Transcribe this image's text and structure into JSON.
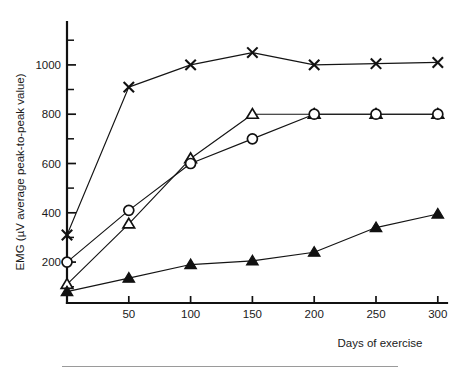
{
  "figure": {
    "background_color": "#ffffff",
    "ink_color": "#111111",
    "footer_rule_color": "#9a9a9a"
  },
  "axes": {
    "y_title": "EMG (µV average peak-to-peak value)",
    "x_title": "Days of exercise",
    "x_ticks": [
      "50",
      "100",
      "150",
      "200",
      "250",
      "300"
    ],
    "y_ticks": [
      "200",
      "400",
      "600",
      "800",
      "1000"
    ]
  },
  "chart_data": {
    "type": "line",
    "title": "",
    "subtitle": "",
    "xlabel": "Days of exercise",
    "ylabel": "EMG (µV average peak-to-peak value)",
    "xlim": [
      0,
      310
    ],
    "ylim": [
      0,
      1150
    ],
    "xticks": [
      50,
      100,
      150,
      200,
      250,
      300
    ],
    "yticks": [
      200,
      400,
      600,
      800,
      1000
    ],
    "y_minor_ticks": [
      100,
      300,
      500,
      700,
      900,
      1100
    ],
    "grid": false,
    "legend": "none",
    "x": [
      0,
      50,
      100,
      150,
      200,
      250,
      300
    ],
    "series": [
      {
        "name": "cross-series",
        "marker": "x",
        "marker_fill": "none",
        "values": [
          310,
          910,
          1000,
          1050,
          1000,
          1005,
          1010
        ]
      },
      {
        "name": "open-triangle-series",
        "marker": "triangle-up",
        "marker_fill": "open",
        "values": [
          110,
          355,
          620,
          800,
          800,
          800,
          800
        ]
      },
      {
        "name": "open-circle-series",
        "marker": "circle",
        "marker_fill": "open",
        "values": [
          200,
          410,
          600,
          700,
          800,
          800,
          800
        ]
      },
      {
        "name": "filled-triangle-series",
        "marker": "triangle-up",
        "marker_fill": "filled",
        "values": [
          80,
          135,
          190,
          205,
          240,
          340,
          395
        ]
      }
    ]
  }
}
